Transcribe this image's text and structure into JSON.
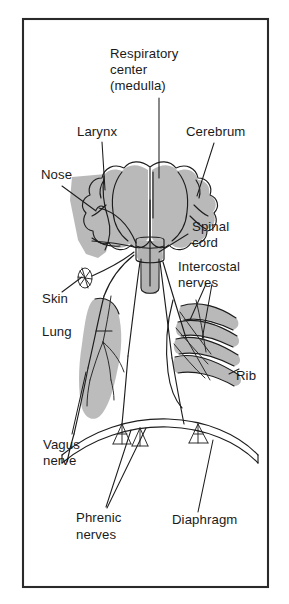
{
  "figure": {
    "background_color": "#ffffff",
    "frame_color": "#2a2a2a",
    "organ_fill_color": "#b8b8b8",
    "line_color": "#1d1d1d",
    "text_color": "#1a1a1a"
  },
  "labels": {
    "respiratory_center": {
      "line1": "Respiratory",
      "line2": "center",
      "line3": "(medulla)"
    },
    "larynx": "Larynx",
    "cerebrum": "Cerebrum",
    "nose": "Nose",
    "spinal_cord": {
      "line1": "Spinal",
      "line2": "cord"
    },
    "intercostal_nerves": {
      "line1": "Intercostal",
      "line2": "nerves"
    },
    "skin": "Skin",
    "lung": "Lung",
    "rib": "Rib",
    "vagus_nerve": {
      "line1": "Vagus",
      "line2": "nerve"
    },
    "phrenic_nerves": {
      "line1": "Phrenic",
      "line2": "nerves"
    },
    "diaphragm": "Diaphragm"
  },
  "structures": [
    {
      "name": "cerebrum",
      "kind": "organ",
      "shaded": true
    },
    {
      "name": "medulla",
      "kind": "organ",
      "shaded": true
    },
    {
      "name": "spinal-cord",
      "kind": "organ",
      "shaded": true
    },
    {
      "name": "nose-larynx",
      "kind": "organ",
      "shaded": true
    },
    {
      "name": "lung",
      "kind": "organ",
      "shaded": true
    },
    {
      "name": "ribs",
      "kind": "organ",
      "shaded": true
    },
    {
      "name": "skin-receptor",
      "kind": "receptor",
      "shaded": false
    },
    {
      "name": "diaphragm",
      "kind": "muscle",
      "shaded": false
    },
    {
      "name": "vagus-nerve",
      "kind": "nerve",
      "shaded": false
    },
    {
      "name": "phrenic-nerves",
      "kind": "nerve",
      "shaded": false
    },
    {
      "name": "intercostal-nerves",
      "kind": "nerve",
      "shaded": false
    }
  ]
}
